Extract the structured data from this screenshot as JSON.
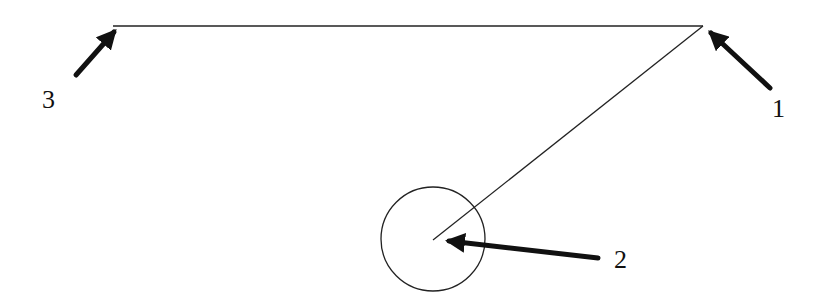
{
  "diagram": {
    "type": "geometry-annotation",
    "lines": [
      {
        "id": "horizontal-line",
        "x1": 113,
        "y1": 26,
        "x2": 703,
        "y2": 26
      },
      {
        "id": "diagonal-line",
        "x1": 703,
        "y1": 26,
        "x2": 433,
        "y2": 240
      }
    ],
    "circle": {
      "cx": 433,
      "cy": 239,
      "r": 52
    },
    "arrows": [
      {
        "id": "arrow-1",
        "from": [
          770,
          88
        ],
        "to": [
          711,
          33
        ],
        "label": "1",
        "label_x": 772,
        "label_y": 117
      },
      {
        "id": "arrow-2",
        "from": [
          598,
          258
        ],
        "to": [
          449,
          241
        ],
        "label": "2",
        "label_x": 614,
        "label_y": 268
      },
      {
        "id": "arrow-3",
        "from": [
          76,
          75
        ],
        "to": [
          114,
          32
        ],
        "label": "3",
        "label_x": 42,
        "label_y": 108
      }
    ],
    "labels": {
      "point_1": "1",
      "point_2": "2",
      "point_3": "3"
    }
  }
}
